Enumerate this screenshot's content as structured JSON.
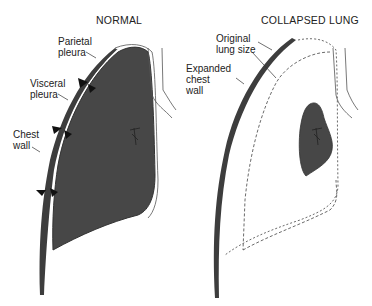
{
  "panels": {
    "normal": {
      "title": "NORMAL",
      "labels": {
        "parietal_pleura": [
          "Parietal",
          "pleura"
        ],
        "visceral_pleura": [
          "Visceral",
          "pleura"
        ],
        "chest_wall": [
          "Chest",
          "wall"
        ]
      }
    },
    "collapsed": {
      "title": "COLLAPSED LUNG",
      "labels": {
        "original_lung_size": [
          "Original",
          "lung size"
        ],
        "expanded_chest_wall": [
          "Expanded",
          "chest",
          "wall"
        ]
      }
    }
  },
  "colors": {
    "lung_fill": "#474747",
    "chest_wall_fill": "#3d3d3d",
    "outline": "#333333",
    "background": "#ffffff"
  }
}
